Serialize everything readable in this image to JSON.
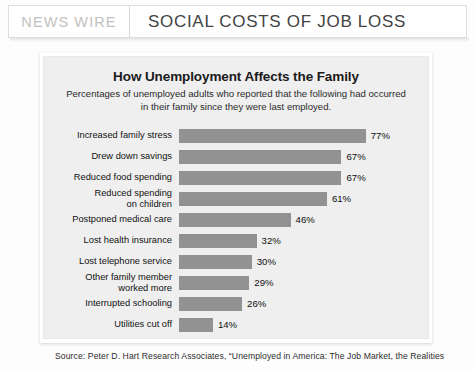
{
  "header": {
    "kicker": "NEWS WIRE",
    "title": "SOCIAL COSTS OF JOB LOSS"
  },
  "chart_data": {
    "type": "bar",
    "orientation": "horizontal",
    "title": "How Unemployment Affects the Family",
    "subtitle": "Percentages of unemployed adults who reported that the following had occurred in their family since they were last employed.",
    "xlabel": "",
    "ylabel": "",
    "xlim": [
      0,
      80
    ],
    "grid": false,
    "legend": null,
    "value_suffix": "%",
    "bar_color": "#929292",
    "panel_color": "#efefef",
    "categories": [
      "Increased family stress",
      "Drew down savings",
      "Reduced food spending",
      "Reduced spending\non children",
      "Postponed medical care",
      "Lost health insurance",
      "Lost telephone service",
      "Other family member\nworked more",
      "Interrupted schooling",
      "Utilities cut off"
    ],
    "values": [
      77,
      67,
      67,
      61,
      46,
      32,
      30,
      29,
      26,
      14
    ],
    "value_labels": [
      "77%",
      "67%",
      "67%",
      "61%",
      "46%",
      "32%",
      "30%",
      "29%",
      "26%",
      "14%"
    ]
  },
  "source": {
    "text": "Source: Peter D. Hart Research Associates, “Unemployed in America: The Job Market, the Realities"
  }
}
